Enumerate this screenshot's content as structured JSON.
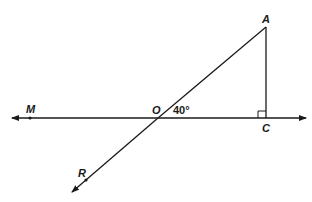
{
  "diagram": {
    "type": "geometry",
    "points": {
      "M": {
        "label": "M",
        "x": 30,
        "y": 118
      },
      "O": {
        "label": "O",
        "x": 158,
        "y": 118
      },
      "C": {
        "label": "C",
        "x": 266,
        "y": 118
      },
      "A": {
        "label": "A",
        "x": 266,
        "y": 27
      },
      "R": {
        "label": "R",
        "x": 86,
        "y": 180
      }
    },
    "angle_label": "40°",
    "right_angle_at": "C",
    "colors": {
      "stroke": "#1a1a1a",
      "background": "#ffffff"
    }
  }
}
